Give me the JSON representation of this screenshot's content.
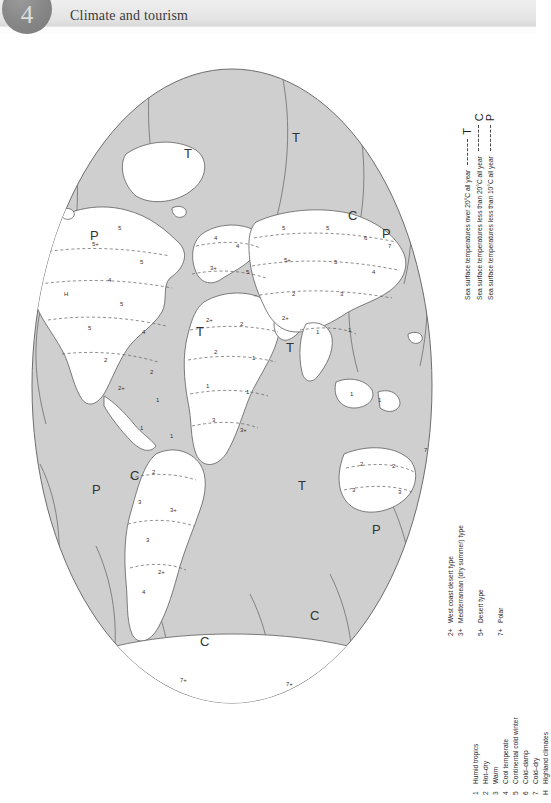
{
  "header": {
    "chapter_number": "4",
    "title": "Climate and tourism",
    "badge_color": "#868686",
    "band_color": "#e4e4e4"
  },
  "map": {
    "projection": "oval / Mollweide-style world map",
    "ocean_color": "#cfcfcf",
    "land_color": "#ffffff",
    "outline_color": "#6d6d6d",
    "boundary_style": "dashed climate-zone boundaries",
    "ocean_codes": [
      "T",
      "C",
      "P"
    ],
    "land_codes": [
      "1",
      "2",
      "3",
      "4",
      "5",
      "6",
      "7",
      "H",
      "2+",
      "3+",
      "5+",
      "7+"
    ]
  },
  "sea_temp_legend": {
    "rows": [
      {
        "label": "Sea surface temperatures over 20°C all year",
        "code": "T"
      },
      {
        "label": "Sea surface temperatures less than 20°C all year",
        "code": "C"
      },
      {
        "label": "Sea surface temperatures less than 10°C all year",
        "code": "P"
      }
    ]
  },
  "climate_legend": {
    "rows": [
      {
        "key": "1",
        "text": "Humid tropics"
      },
      {
        "key": "2",
        "text": "Hot–dry"
      },
      {
        "key": "3",
        "text": "Warm"
      },
      {
        "key": "4",
        "text": "Cool temperate"
      },
      {
        "key": "5",
        "text": "Continental cold winter"
      },
      {
        "key": "6",
        "text": "Cold–damp"
      },
      {
        "key": "7",
        "text": "Cold–dry"
      },
      {
        "key": "H",
        "text": "Highland climates"
      }
    ]
  },
  "subtype_legend": {
    "rows": [
      {
        "key": "2+",
        "text": "West coast desert type",
        "gap": false
      },
      {
        "key": "3+",
        "text": "Mediterranean (dry summer) type",
        "gap": false
      },
      {
        "key": "5+",
        "text": "Desert type",
        "gap": true
      },
      {
        "key": "7+",
        "text": "Polar",
        "gap": true
      }
    ]
  }
}
